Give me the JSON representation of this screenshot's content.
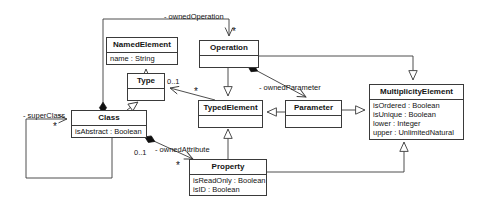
{
  "diagram": {
    "stroke_color": "#3a3a3a",
    "text_color": "#141414",
    "background": "#ffffff",
    "classes": [
      {
        "id": "namedelement",
        "name": "NamedElement",
        "attributes": [
          "name : String"
        ],
        "x": 106,
        "y": 37,
        "w": 72,
        "h": 28
      },
      {
        "id": "operation",
        "name": "Operation",
        "attributes": [],
        "x": 199,
        "y": 40,
        "w": 60,
        "h": 26
      },
      {
        "id": "type",
        "name": "Type",
        "attributes": [],
        "x": 127,
        "y": 73,
        "w": 38,
        "h": 25
      },
      {
        "id": "multiplicityelement",
        "name": "MultiplicityElement",
        "attributes": [
          "isOrdered : Boolean",
          "isUnique : Boolean",
          "lower : Integer",
          "upper : UnlimitedNatural"
        ],
        "x": 369,
        "y": 84,
        "w": 95,
        "h": 54
      },
      {
        "id": "typedelement",
        "name": "TypedElement",
        "attributes": [],
        "x": 198,
        "y": 100,
        "w": 65,
        "h": 25
      },
      {
        "id": "parameter",
        "name": "Parameter",
        "attributes": [],
        "x": 285,
        "y": 100,
        "w": 57,
        "h": 25
      },
      {
        "id": "class",
        "name": "Class",
        "attributes": [
          "isAbstract : Boolean"
        ],
        "x": 71,
        "y": 110,
        "w": 76,
        "h": 27
      },
      {
        "id": "property",
        "name": "Property",
        "attributes": [
          "isReadOnly : Boolean",
          "isID : Boolean"
        ],
        "x": 189,
        "y": 159,
        "w": 78,
        "h": 36
      }
    ],
    "edge_labels": [
      {
        "id": "ownedOperation",
        "text": "- ownedOperation",
        "x": 164,
        "y": 13
      },
      {
        "id": "ownedParameter",
        "text": "- ownedParameter",
        "x": 259,
        "y": 84
      },
      {
        "id": "superClass",
        "text": "- superClass",
        "x": 23,
        "y": 112
      },
      {
        "id": "ownedAttribute",
        "text": "- ownedAttribute",
        "x": 155,
        "y": 146
      }
    ],
    "multiplicities": [
      {
        "id": "type-mult",
        "text": "0..1",
        "x": 167,
        "y": 78
      },
      {
        "id": "attribute-mult",
        "text": "0..1",
        "x": 134,
        "y": 149
      }
    ],
    "star_multiplicities": [
      {
        "id": "operation-star",
        "text": "*",
        "x": 232,
        "y": 27
      },
      {
        "id": "type-star",
        "text": "*",
        "x": 194,
        "y": 87
      },
      {
        "id": "superclass-star",
        "text": "*",
        "x": 53,
        "y": 122
      },
      {
        "id": "property-star",
        "text": "*",
        "x": 176,
        "y": 161
      }
    ],
    "relationships": [
      {
        "from": "Class",
        "to": "Operation",
        "label": "- ownedOperation",
        "kind": "composition",
        "target_multiplicity": "*"
      },
      {
        "from": "Operation",
        "to": "Parameter",
        "label": "- ownedParameter",
        "kind": "composition"
      },
      {
        "from": "Class",
        "to": "Property",
        "label": "- ownedAttribute",
        "kind": "composition",
        "source_multiplicity": "0..1",
        "target_multiplicity": "*"
      },
      {
        "from": "Class",
        "to": "Class",
        "label": "- superClass",
        "kind": "association",
        "target_multiplicity": "*"
      },
      {
        "from": "Type",
        "to": "NamedElement",
        "kind": "generalization"
      },
      {
        "from": "Class",
        "to": "Type",
        "kind": "generalization"
      },
      {
        "from": "TypedElement",
        "to": "Type",
        "kind": "association",
        "target_multiplicity": "0..1",
        "source_multiplicity": "*"
      },
      {
        "from": "Operation",
        "to": "TypedElement",
        "kind": "generalization"
      },
      {
        "from": "Parameter",
        "to": "TypedElement",
        "kind": "generalization"
      },
      {
        "from": "Property",
        "to": "TypedElement",
        "kind": "generalization"
      },
      {
        "from": "Operation",
        "to": "MultiplicityElement",
        "kind": "generalization"
      },
      {
        "from": "Parameter",
        "to": "MultiplicityElement",
        "kind": "generalization"
      },
      {
        "from": "Property",
        "to": "MultiplicityElement",
        "kind": "generalization"
      }
    ]
  }
}
